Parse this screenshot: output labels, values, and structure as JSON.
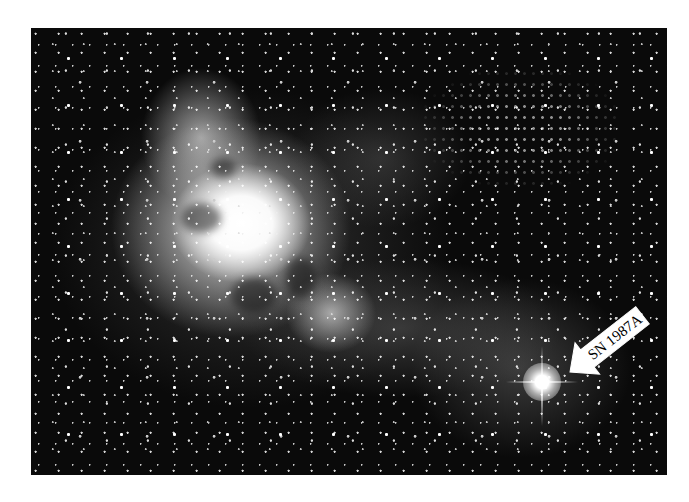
{
  "image": {
    "subject": "Tarantula Nebula star-forming region with supernova",
    "style": "grayscale astronomical photograph",
    "colors": {
      "background": "#ffffff",
      "sky": "#0a0a0a",
      "nebula": "#f5f5f5",
      "label_fill": "#ffffff",
      "label_text": "#000000"
    }
  },
  "annotation": {
    "label": "SN 1987A",
    "pointer": "arrow-pointing-down-left"
  }
}
